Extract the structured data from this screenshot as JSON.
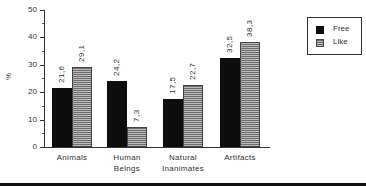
{
  "chart_data": {
    "type": "bar",
    "title": "",
    "xlabel": "",
    "ylabel": "%",
    "ylim": [
      0,
      50
    ],
    "yticks": [
      "0",
      "10",
      "20",
      "30",
      "40",
      "50"
    ],
    "grid": false,
    "legend_position": "upper right",
    "categories": [
      "Animals",
      "Human Beings",
      "Natural Inanimates",
      "Artifacts"
    ],
    "category_lines": [
      [
        "Animals"
      ],
      [
        "Human",
        "Beings"
      ],
      [
        "Natural",
        "Inanimates"
      ],
      [
        "Artifacts"
      ]
    ],
    "series": [
      {
        "name": "Free",
        "values": [
          21.6,
          24.2,
          17.5,
          32.5
        ],
        "labels": [
          "21,6",
          "24,2",
          "17,5",
          "32,5"
        ],
        "color": "#0d0d0d"
      },
      {
        "name": "Like",
        "values": [
          29.1,
          7.3,
          22.7,
          38.3
        ],
        "labels": [
          "29,1",
          "7,3",
          "22,7",
          "38,3"
        ],
        "color": "#8a8a8a"
      }
    ]
  }
}
